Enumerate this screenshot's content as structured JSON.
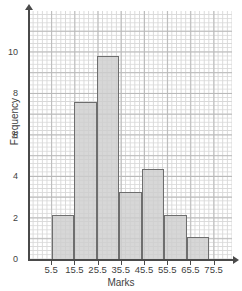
{
  "chart_data": {
    "type": "bar",
    "title": "",
    "subtitle": "",
    "xlabel": "Marks",
    "ylabel": "Frequency",
    "categories": [
      "5.5-15.5",
      "15.5-25.5",
      "25.5-35.5",
      "35.5-45.5",
      "45.5-55.5",
      "55.5-65.5",
      "65.5-75.5"
    ],
    "bin_edges": [
      5.5,
      15.5,
      25.5,
      35.5,
      45.5,
      55.5,
      65.5,
      75.5
    ],
    "values": [
      2,
      7,
      9,
      3,
      4,
      2,
      1
    ],
    "xtick_labels": [
      "5.5",
      "15.5",
      "25.5",
      "35.5",
      "45.5",
      "55.5",
      "65.5",
      "75.5"
    ],
    "ytick_labels": [
      "0",
      "2",
      "4",
      "6",
      "8",
      "10"
    ],
    "ytick_values": [
      0,
      2,
      4,
      6,
      8,
      10
    ],
    "ylim": [
      0,
      11
    ],
    "xlim": [
      -4.5,
      85.5
    ],
    "grid": true,
    "legend": "none",
    "bar_fill_color": "#cdcdcd",
    "bar_border_color": "#6e6e6e",
    "grid_major_color": "#b9b9b9",
    "grid_minor_color": "#d8d8d8",
    "axis_color": "#4a4a4a"
  }
}
